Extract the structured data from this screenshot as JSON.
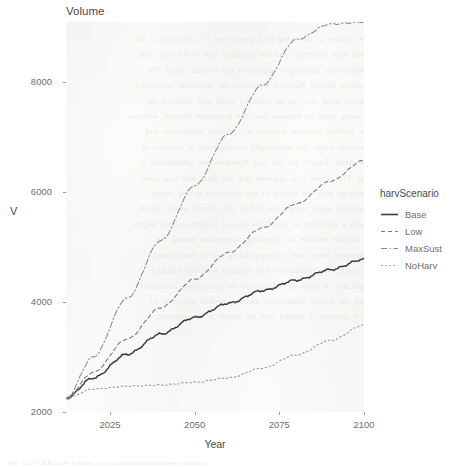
{
  "figure": {
    "title": "Volume",
    "caption_fragment": "Fig. 11.2  FDFB forest volume projections under four harvest scenarios"
  },
  "axes": {
    "x_title": "Year",
    "y_title": "V",
    "x_ticks": [
      "2025",
      "2050",
      "2075",
      "2100"
    ],
    "y_ticks": [
      "2000",
      "4000",
      "6000",
      "8000"
    ]
  },
  "legend": {
    "title": "harvScenario",
    "position": "right",
    "items": [
      {
        "label": "Base",
        "dash": "none",
        "color": "#3d3d3d"
      },
      {
        "label": "Low",
        "dash": "dashed",
        "color": "#777777"
      },
      {
        "label": "MaxSust",
        "dash": "dashdot",
        "color": "#8a8a8a"
      },
      {
        "label": "NoHarv",
        "dash": "dotted",
        "color": "#9a9a9a"
      }
    ]
  },
  "bleed_text": "the volume of the stand in a given year is a function of the\nbasal area increment and the mortality rate of the trees that\nremain after thinning is applied to the residual stand. The\nscenario labeled MaxSust represents the maximum sustainable\nharvest level that can be removed while still allowing the\ngrowing stock to increase over the projection horizon, whereas\nthe NoHarv scenario assumes no removals whatsoever and\ntherefore tracks the unmanaged accumulation of biomass in\nthe stand. Results for the four Scenarios are summarized in\nFig. 11.2 where it is apparent that the Base and Low cases\nconverge near the middle of the projection period before\ndiverging again toward the end of the century as the stands\nreach a condition in which the rate of volume accrual begins\nto decline because of increasing competition among the\nremaining stems and a corresponding rise in background\nmortality. The simulation was repeated with one hundred\nreplicates in order to characterize the uncertainty associated\nwith the growth parameters, and the median trajectory of\neach scenario is plotted here for clarity of presentation.",
  "chart_data": {
    "type": "line",
    "title": "Volume",
    "xlabel": "Year",
    "ylabel": "V",
    "xlim": [
      2012,
      2100
    ],
    "ylim": [
      2000,
      9100
    ],
    "grid": false,
    "legend_position": "right",
    "legend_title": "harvScenario",
    "x": [
      2012,
      2020,
      2030,
      2040,
      2050,
      2060,
      2070,
      2080,
      2090,
      2100
    ],
    "series": [
      {
        "name": "Base",
        "dash": "none",
        "color": "#3d3d3d",
        "values": [
          2250,
          2620,
          3050,
          3420,
          3720,
          3980,
          4210,
          4400,
          4590,
          4780
        ]
      },
      {
        "name": "Low",
        "dash": "dashed",
        "color": "#777777",
        "values": [
          2250,
          2720,
          3330,
          3900,
          4420,
          4900,
          5350,
          5790,
          6200,
          6580
        ]
      },
      {
        "name": "MaxSust",
        "dash": "dashdot",
        "color": "#8a8a8a",
        "values": [
          2250,
          3000,
          4070,
          5120,
          6120,
          7060,
          7950,
          8780,
          9060,
          9100
        ]
      },
      {
        "name": "NoHarv",
        "dash": "dotted",
        "color": "#9a9a9a",
        "values": [
          2250,
          2420,
          2470,
          2490,
          2540,
          2620,
          2800,
          3040,
          3300,
          3580
        ]
      }
    ]
  }
}
